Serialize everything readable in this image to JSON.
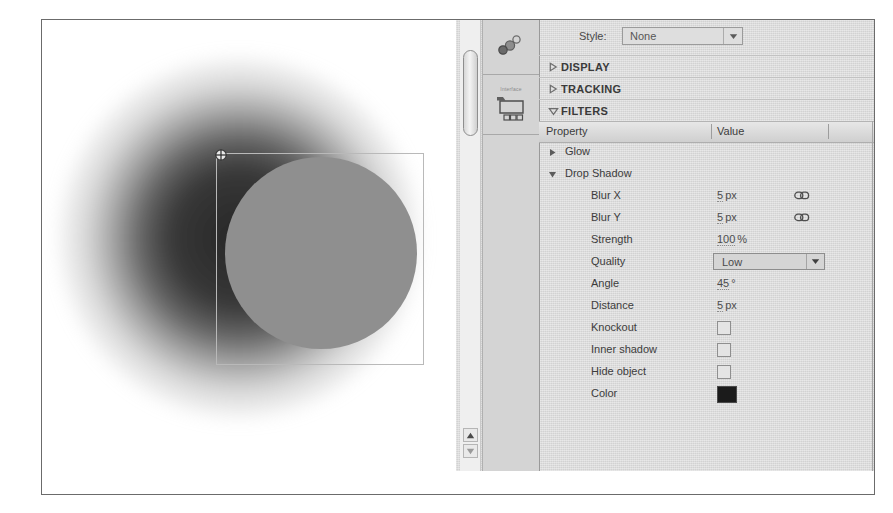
{
  "app": {
    "panel_name": "Properties / Filters panel",
    "canvas": {
      "object_name": "circle-shape",
      "registration_point": "registration-point-crosshair",
      "shadow_color": "#1e1e1e",
      "object_fill": "#8f8f8f",
      "selection_border": "#b9b9b9"
    }
  },
  "dock": {
    "items": [
      {
        "name": "effects-icon",
        "label": ""
      },
      {
        "name": "library-icon",
        "label": "Interface"
      }
    ]
  },
  "style": {
    "label": "Style:",
    "value": "None",
    "arrow": "▼"
  },
  "sections": [
    {
      "name": "display",
      "title": "DISPLAY",
      "expanded": false,
      "triangle": "▷"
    },
    {
      "name": "tracking",
      "title": "TRACKING",
      "expanded": false,
      "triangle": "▷"
    },
    {
      "name": "filters",
      "title": "FILTERS",
      "expanded": true,
      "triangle": "▽"
    }
  ],
  "table": {
    "headers": {
      "property": "Property",
      "value": "Value"
    },
    "rows": [
      {
        "name": "glow",
        "label": "Glow",
        "indent": 0,
        "triangle": "▶",
        "expanded": false,
        "control": "none",
        "value": ""
      },
      {
        "name": "drop-shadow",
        "label": "Drop Shadow",
        "indent": 0,
        "triangle": "▼",
        "expanded": true,
        "control": "none",
        "value": ""
      },
      {
        "name": "blur-x",
        "label": "Blur X",
        "indent": 1,
        "control": "number",
        "value": "5",
        "unit": "px",
        "link": true
      },
      {
        "name": "blur-y",
        "label": "Blur Y",
        "indent": 1,
        "control": "number",
        "value": "5",
        "unit": "px",
        "link": true
      },
      {
        "name": "strength",
        "label": "Strength",
        "indent": 1,
        "control": "number",
        "value": "100",
        "unit": "%",
        "link": false
      },
      {
        "name": "quality",
        "label": "Quality",
        "indent": 1,
        "control": "dropdown",
        "value": "Low",
        "arrow": "▼"
      },
      {
        "name": "angle",
        "label": "Angle",
        "indent": 1,
        "control": "number",
        "value": "45",
        "unit": "°",
        "link": false
      },
      {
        "name": "distance",
        "label": "Distance",
        "indent": 1,
        "control": "number",
        "value": "5",
        "unit": "px",
        "link": false
      },
      {
        "name": "knockout",
        "label": "Knockout",
        "indent": 1,
        "control": "checkbox",
        "checked": false
      },
      {
        "name": "inner-shadow",
        "label": "Inner shadow",
        "indent": 1,
        "control": "checkbox",
        "checked": false
      },
      {
        "name": "hide-object",
        "label": "Hide object",
        "indent": 1,
        "control": "checkbox",
        "checked": false
      },
      {
        "name": "color",
        "label": "Color",
        "indent": 1,
        "control": "swatch",
        "value": "#1b1b1b"
      }
    ]
  },
  "scrollbar": {
    "up_arrow": "▲",
    "down_arrow": "▼"
  }
}
